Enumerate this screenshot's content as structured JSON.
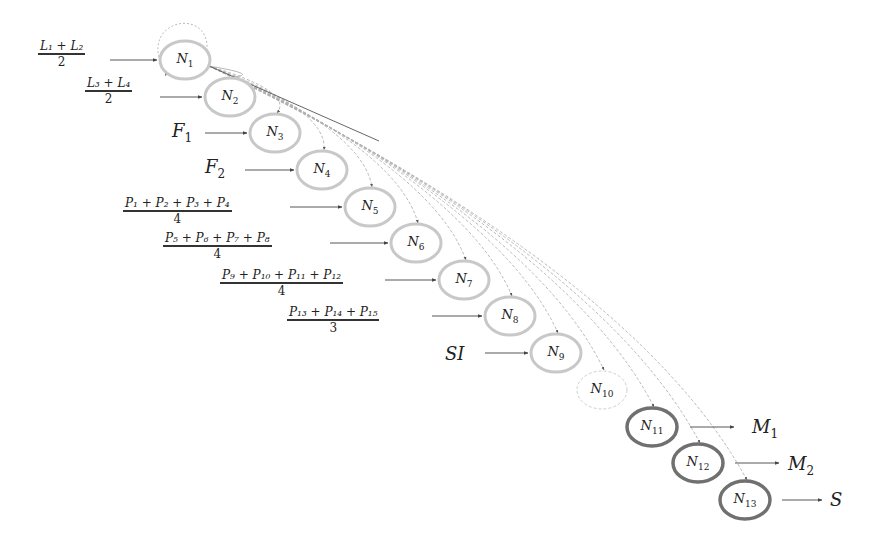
{
  "diagram": {
    "type": "neural-flow",
    "nodes": [
      {
        "id": "N1",
        "label": "N",
        "sub": "1",
        "cx": 185,
        "cy": 60,
        "style": "light"
      },
      {
        "id": "N2",
        "label": "N",
        "sub": "2",
        "cx": 230,
        "cy": 97,
        "style": "light"
      },
      {
        "id": "N3",
        "label": "N",
        "sub": "3",
        "cx": 275,
        "cy": 133,
        "style": "light"
      },
      {
        "id": "N4",
        "label": "N",
        "sub": "4",
        "cx": 322,
        "cy": 170,
        "style": "light"
      },
      {
        "id": "N5",
        "label": "N",
        "sub": "5",
        "cx": 370,
        "cy": 207,
        "style": "light"
      },
      {
        "id": "N6",
        "label": "N",
        "sub": "6",
        "cx": 416,
        "cy": 243,
        "style": "light"
      },
      {
        "id": "N7",
        "label": "N",
        "sub": "7",
        "cx": 464,
        "cy": 280,
        "style": "light"
      },
      {
        "id": "N8",
        "label": "N",
        "sub": "8",
        "cx": 510,
        "cy": 316,
        "style": "light"
      },
      {
        "id": "N9",
        "label": "N",
        "sub": "9",
        "cx": 556,
        "cy": 353,
        "style": "light"
      },
      {
        "id": "N10",
        "label": "N",
        "sub": "10",
        "cx": 602,
        "cy": 390,
        "style": "dashed"
      },
      {
        "id": "N11",
        "label": "N",
        "sub": "11",
        "cx": 652,
        "cy": 427,
        "style": "dark"
      },
      {
        "id": "N12",
        "label": "N",
        "sub": "12",
        "cx": 698,
        "cy": 463,
        "style": "dark"
      },
      {
        "id": "N13",
        "label": "N",
        "sub": "13",
        "cx": 745,
        "cy": 500,
        "style": "dark"
      }
    ],
    "inputs": [
      {
        "target": "N1",
        "kind": "frac",
        "num": "L₁ + L₂",
        "den": "2",
        "x": 38,
        "y": 40,
        "arrow_from": 110,
        "arrow_to": 157
      },
      {
        "target": "N2",
        "kind": "frac",
        "num": "L₃ + L₄",
        "den": "2",
        "x": 85,
        "y": 77,
        "arrow_from": 160,
        "arrow_to": 202
      },
      {
        "target": "N3",
        "kind": "text",
        "text": "F",
        "sub": "1",
        "x": 172,
        "y": 120,
        "arrow_from": 205,
        "arrow_to": 247
      },
      {
        "target": "N4",
        "kind": "text",
        "text": "F",
        "sub": "2",
        "x": 205,
        "y": 156,
        "arrow_from": 245,
        "arrow_to": 294
      },
      {
        "target": "N5",
        "kind": "frac",
        "num": "P₁ + P₂ + P₃ + P₄",
        "den": "4",
        "x": 123,
        "y": 197,
        "arrow_from": 290,
        "arrow_to": 342
      },
      {
        "target": "N6",
        "kind": "frac",
        "num": "P₅ + P₆ + P₇ + P₈",
        "den": "4",
        "x": 163,
        "y": 232,
        "arrow_from": 330,
        "arrow_to": 388
      },
      {
        "target": "N7",
        "kind": "frac",
        "num": "P₉ + P₁₀ + P₁₁ + P₁₂",
        "den": "4",
        "x": 220,
        "y": 269,
        "arrow_from": 385,
        "arrow_to": 436
      },
      {
        "target": "N8",
        "kind": "frac",
        "num": "P₁₃ + P₁₄ + P₁₅",
        "den": "3",
        "x": 287,
        "y": 306,
        "arrow_from": 432,
        "arrow_to": 482
      },
      {
        "target": "N9",
        "kind": "text",
        "text": "SI",
        "sub": "",
        "x": 445,
        "y": 343,
        "arrow_from": 485,
        "arrow_to": 528
      }
    ],
    "outputs": [
      {
        "source": "N11",
        "text": "M",
        "sub": "1",
        "x": 752,
        "y": 416,
        "arrow_from": 690,
        "arrow_to": 734
      },
      {
        "source": "N12",
        "text": "M",
        "sub": "2",
        "x": 788,
        "y": 453,
        "arrow_from": 735,
        "arrow_to": 779
      },
      {
        "source": "N13",
        "text": "S",
        "sub": "",
        "x": 830,
        "y": 489,
        "arrow_from": 782,
        "arrow_to": 822
      }
    ],
    "self_loop": {
      "node": "N1"
    },
    "colors": {
      "light_node": "#c8c8c8",
      "dashed_node": "#cfcfcf",
      "dark_node": "#707070",
      "curve": "#b0b0b0",
      "arrow": "#444444",
      "text": "#222222"
    }
  }
}
